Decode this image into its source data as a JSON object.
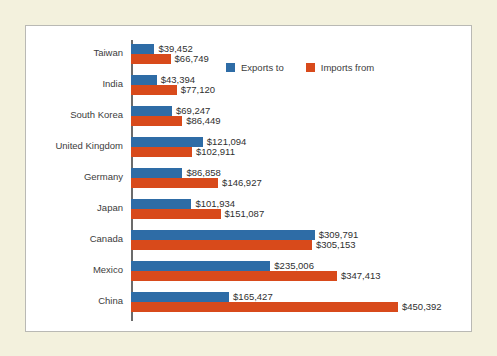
{
  "chart_data": {
    "type": "bar",
    "orientation": "horizontal",
    "title": "",
    "xlabel": "",
    "ylabel": "",
    "grid": false,
    "legend_position": "top-right",
    "xlim": [
      0,
      450392
    ],
    "categories": [
      "Taiwan",
      "India",
      "South Korea",
      "United Kingdom",
      "Germany",
      "Japan",
      "Canada",
      "Mexico",
      "China"
    ],
    "series": [
      {
        "name": "Exports to",
        "color": "#2e6ca6",
        "values": [
          39452,
          43394,
          69247,
          121094,
          86858,
          101934,
          309791,
          235006,
          165427
        ],
        "labels": [
          "$39,452",
          "$43,394",
          "$69,247",
          "$121,094",
          "$86,858",
          "$101,934",
          "$309,791",
          "$235,006",
          "$165,427"
        ]
      },
      {
        "name": "Imports from",
        "color": "#d84a1b",
        "values": [
          66749,
          77120,
          86449,
          102911,
          146927,
          151087,
          305153,
          347413,
          450392
        ],
        "labels": [
          "$66,749",
          "$77,120",
          "$86,449",
          "$102,911",
          "$146,927",
          "$151,087",
          "$305,153",
          "$347,413",
          "$450,392"
        ]
      }
    ]
  },
  "legend": {
    "items": [
      {
        "label": "Exports to",
        "color": "#2e6ca6"
      },
      {
        "label": "Imports from",
        "color": "#d84a1b"
      }
    ]
  },
  "colors": {
    "page_background": "#f3f1dd",
    "panel_background": "#ffffff",
    "panel_border": "#b9b9b4",
    "axis": "#6b6b6b",
    "exports": "#2e6ca6",
    "imports": "#d84a1b",
    "text": "#3c3c3c"
  }
}
